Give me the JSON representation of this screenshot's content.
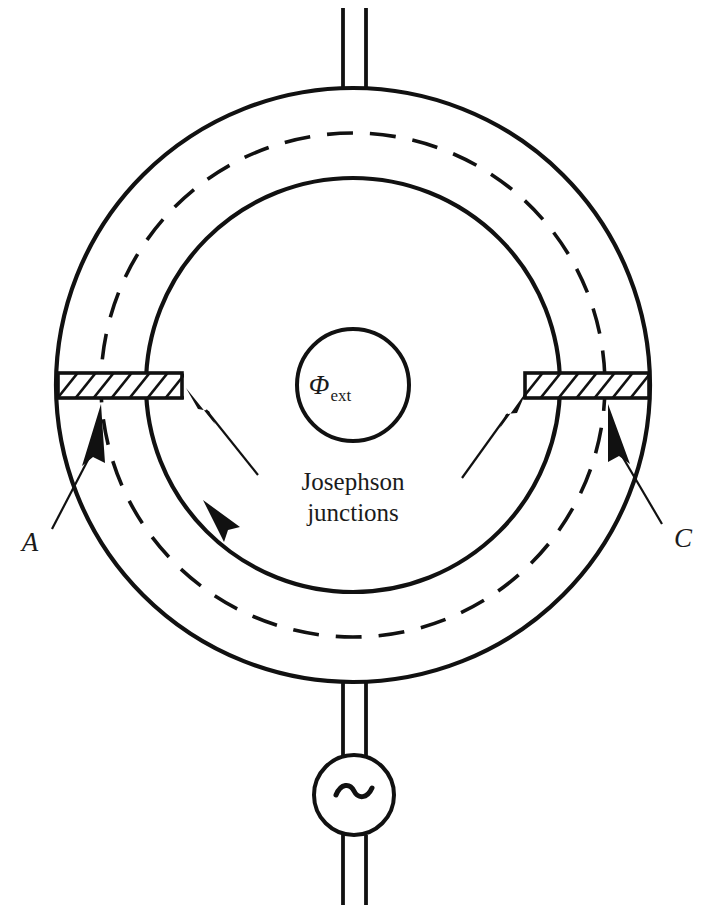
{
  "figure": {
    "background_color": "#ffffff",
    "line_color": "#111111"
  },
  "labels": {
    "flux_symbol": "Φ",
    "flux_subscript": "ext",
    "josephson_line1": "Josephson",
    "josephson_line2": "junctions",
    "node_left": "A",
    "node_right": "C"
  },
  "components": {
    "outer_ring_label": "outer-superconducting-ring",
    "inner_ring_label": "inner-superconducting-ring",
    "dashed_loop_label": "supercurrent-circulation-loop",
    "flux_circle_label": "external-flux-region",
    "junction_left_label": "josephson-junction-left",
    "junction_right_label": "josephson-junction-right",
    "source_label": "ac-source",
    "source_symbol": "~",
    "lead_top_label": "top-lead",
    "lead_bottom_label": "bottom-lead"
  },
  "geometry": {
    "center_x": 353,
    "center_y": 385,
    "outer_radius": 297,
    "inner_radius": 207,
    "dashed_radius": 252,
    "flux_radius": 56,
    "junction_y": 385,
    "junction_height": 26,
    "source_center_y": 795,
    "source_radius": 40
  }
}
